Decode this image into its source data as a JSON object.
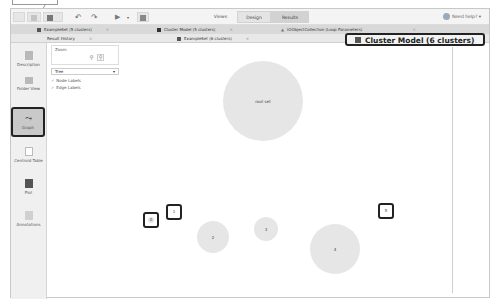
{
  "toolbar": {
    "buttons": [
      "new-process",
      "open",
      "save",
      "undo",
      "redo",
      "run",
      "stop"
    ],
    "mode_label": "Views:",
    "design_tab": "Design",
    "results_tab": "Results",
    "help_label": "Need help?"
  },
  "document_tabs": {
    "row1": [
      {
        "label": "ExampleSet (5 clusters)",
        "icon": "table-icon"
      },
      {
        "label": "Cluster Model (5 clusters)",
        "icon": "model-icon"
      },
      {
        "label": "IOObjectCollection (Loop Parameters)",
        "icon": "warning-icon"
      }
    ],
    "row2": [
      {
        "label": "Result History"
      },
      {
        "label": "ExampleSet (6 clusters)",
        "icon": "table-icon"
      }
    ],
    "active": {
      "label": "Cluster Model (6 clusters)"
    }
  },
  "sidebar": {
    "items": [
      {
        "label": "Description"
      },
      {
        "label": "Folder View"
      },
      {
        "label": "Graph",
        "selected": true
      },
      {
        "label": "Centroid Table"
      },
      {
        "label": "Plot"
      },
      {
        "label": "Annotations"
      }
    ]
  },
  "panel": {
    "zoom_label": "Zoom",
    "zoom_in": "+",
    "zoom_out": "-",
    "layout_select": "Tree",
    "node_labels": "Node Labels",
    "edge_labels": "Edge Labels",
    "node_labels_checked": true,
    "edge_labels_checked": true
  },
  "graph": {
    "root_label": "root set",
    "nodes": [
      {
        "label": "0",
        "highlighted": true
      },
      {
        "label": "1",
        "highlighted": true
      },
      {
        "label": "2"
      },
      {
        "label": "3"
      },
      {
        "label": "4"
      },
      {
        "label": "5",
        "highlighted": true
      }
    ]
  }
}
